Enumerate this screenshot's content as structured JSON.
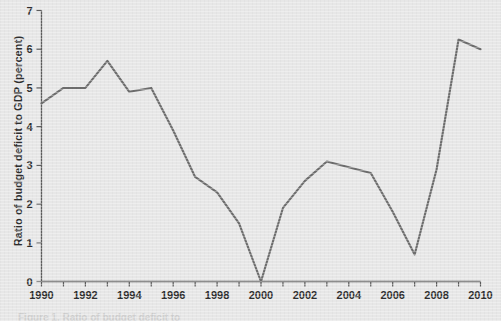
{
  "figure": {
    "ylabel": "Ratio of budget deficit to GDP (percent)",
    "caption_partial": "Figure 1. Ratio of budget deficit to"
  },
  "axes": {
    "y_ticks": [
      "0",
      "1",
      "2",
      "3",
      "4",
      "5",
      "6",
      "7"
    ],
    "x_ticks": [
      "1990",
      "1992",
      "1994",
      "1996",
      "1998",
      "2000",
      "2002",
      "2004",
      "2006",
      "2008",
      "2010"
    ]
  },
  "colors": {
    "background": "#e7e7e7",
    "line": "#6d6d6d",
    "axis": "#5c5c5c",
    "text": "#2e2e2e"
  },
  "chart_data": {
    "type": "line",
    "title": "",
    "xlabel": "",
    "ylabel": "Ratio of budget deficit to GDP (percent)",
    "xlim": [
      1990,
      2010
    ],
    "ylim": [
      0,
      7
    ],
    "grid": false,
    "legend": "none",
    "x": [
      1990,
      1991,
      1992,
      1993,
      1994,
      1995,
      1996,
      1997,
      1998,
      1999,
      2000,
      2001,
      2002,
      2003,
      2004,
      2005,
      2006,
      2007,
      2008,
      2009,
      2010
    ],
    "values": [
      4.6,
      5.0,
      5.0,
      5.7,
      4.9,
      5.0,
      3.9,
      2.7,
      2.3,
      1.5,
      0.0,
      1.9,
      2.6,
      3.1,
      2.95,
      2.8,
      1.8,
      0.7,
      2.9,
      6.25,
      6.0
    ],
    "x_tick_labels": [
      "1990",
      "1992",
      "1994",
      "1996",
      "1998",
      "2000",
      "2002",
      "2004",
      "2006",
      "2008",
      "2010"
    ],
    "x_tick_values": [
      1990,
      1992,
      1994,
      1996,
      1998,
      2000,
      2002,
      2004,
      2006,
      2008,
      2010
    ],
    "y_tick_labels": [
      "0",
      "1",
      "2",
      "3",
      "4",
      "5",
      "6",
      "7"
    ],
    "y_tick_values": [
      0,
      1,
      2,
      3,
      4,
      5,
      6,
      7
    ]
  }
}
